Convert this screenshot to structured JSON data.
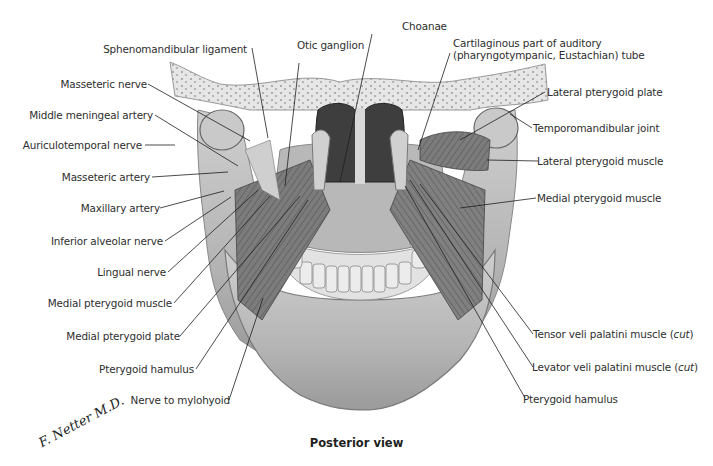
{
  "figure": {
    "caption": "Posterior view",
    "signature": "F. Netter M.D.",
    "illustration": "Posterior view of mandible with pterygoid muscles, teeth, choanae and temporomandibular joints"
  },
  "labels_left": [
    {
      "id": "sphenomandibular-ligament",
      "text": "Sphenomandibular ligament"
    },
    {
      "id": "masseteric-nerve",
      "text": "Masseteric nerve"
    },
    {
      "id": "middle-meningeal-artery",
      "text": "Middle meningeal artery"
    },
    {
      "id": "auriculotemporal-nerve",
      "text": "Auriculotemporal nerve"
    },
    {
      "id": "masseteric-artery",
      "text": "Masseteric artery"
    },
    {
      "id": "maxillary-artery",
      "text": "Maxillary artery"
    },
    {
      "id": "inferior-alveolar-nerve",
      "text": "Inferior alveolar nerve"
    },
    {
      "id": "lingual-nerve",
      "text": "Lingual nerve"
    },
    {
      "id": "medial-pterygoid-muscle-left",
      "text": "Medial pterygoid muscle"
    },
    {
      "id": "medial-pterygoid-plate",
      "text": "Medial pterygoid plate"
    },
    {
      "id": "pterygoid-hamulus-left",
      "text": "Pterygoid hamulus"
    },
    {
      "id": "nerve-to-mylohyoid",
      "text": "Nerve to mylohyoid"
    }
  ],
  "labels_top": [
    {
      "id": "otic-ganglion",
      "text": "Otic ganglion"
    },
    {
      "id": "choanae",
      "text": "Choanae"
    },
    {
      "id": "auditory-tube-line1",
      "text": "Cartilaginous part of auditory"
    },
    {
      "id": "auditory-tube-line2",
      "text": "(pharyngotympanic, Eustachian) tube"
    }
  ],
  "labels_right": [
    {
      "id": "lateral-pterygoid-plate",
      "text": "Lateral pterygoid plate"
    },
    {
      "id": "temporomandibular-joint",
      "text": "Temporomandibular joint"
    },
    {
      "id": "lateral-pterygoid-muscle",
      "text": "Lateral pterygoid muscle"
    },
    {
      "id": "medial-pterygoid-muscle-right",
      "text": "Medial pterygoid muscle"
    },
    {
      "id": "tensor-veli-palatini",
      "text": "Tensor veli palatini muscle (",
      "italic": "cut",
      ")": ")"
    },
    {
      "id": "levator-veli-palatini",
      "text": "Levator veli palatini muscle (",
      "italic": "cut"
    },
    {
      "id": "pterygoid-hamulus-right",
      "text": "Pterygoid hamulus"
    }
  ],
  "colors": {
    "text": "#2e2e2e",
    "bone_light": "#d9d9d9",
    "bone_mid": "#a8a8a8",
    "bone_dark": "#6e6e6e",
    "muscle": "#7a7a7a",
    "leader_line": "#1e1e1e"
  }
}
